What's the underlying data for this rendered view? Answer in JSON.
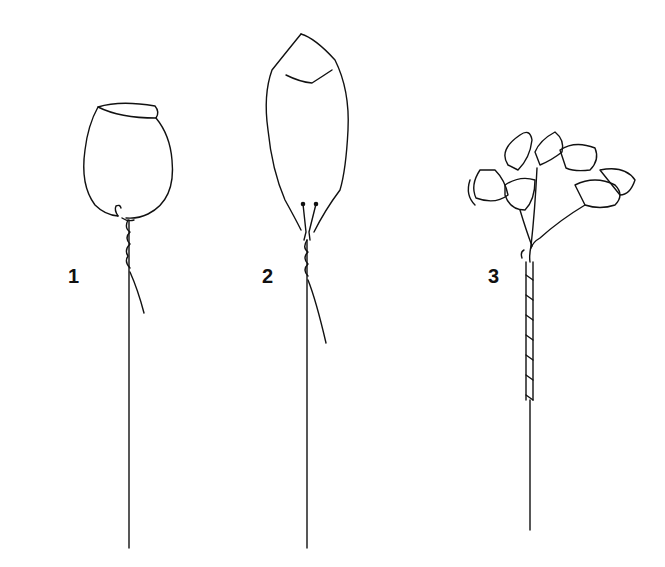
{
  "figure": {
    "panels": [
      {
        "label": "1",
        "subject": "single cupped flower head wired with hooked wire twisted around stem"
      },
      {
        "label": "2",
        "subject": "elongated bud/leaf shape with two wire ends pushed through base and twisted around stem"
      },
      {
        "label": "3",
        "subject": "cluster of small trumpet-shaped florets on branching wires bound together and taped down the stem"
      }
    ],
    "colors": {
      "ink": "#111111",
      "background": "#ffffff"
    }
  }
}
